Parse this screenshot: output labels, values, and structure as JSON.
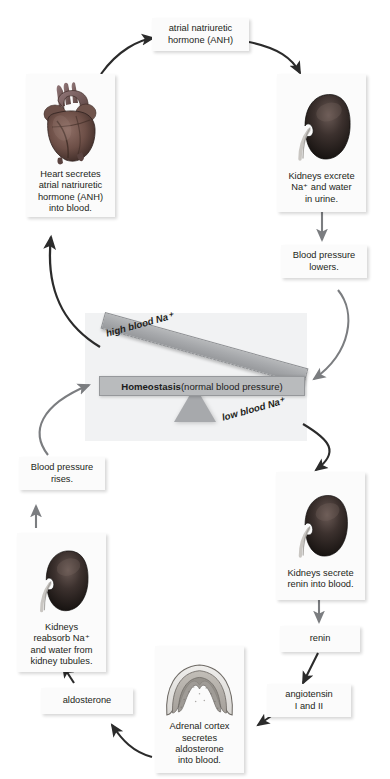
{
  "diagram": {
    "center_label": {
      "bold": "Homeostasis",
      "rest": " (normal blood pressure)"
    },
    "seesaw": {
      "high_label": "high blood Na⁺",
      "low_label": "low blood Na⁺"
    },
    "nodes": {
      "anh_hormone": "atrial natriuretic\nhormone (ANH)",
      "heart": "Heart secretes\natrial natriuretic\nhormone (ANH)\ninto blood.",
      "kidney_excrete": "Kidneys excrete\nNa⁺ and water\nin urine.",
      "bp_lowers": "Blood pressure\nlowers.",
      "kidney_renin": "Kidneys secrete\nrenin into blood.",
      "renin": "renin",
      "angiotensin": "angiotensin\nI and II",
      "adrenal": "Adrenal cortex\nsecretes\naldosterone\ninto blood.",
      "aldosterone": "aldosterone",
      "kidney_reabsorb": "Kidneys\nreabsorb Na⁺\nand water from\nkidney tubules.",
      "bp_rises": "Blood pressure\nrises."
    },
    "icons": {
      "heart": "heart-organ-image",
      "kidney": "kidney-organ-image",
      "adrenal": "adrenal-cortex-image"
    },
    "colors": {
      "arrow_dark": "#2b2b2b",
      "arrow_gray": "#7b7d80",
      "beam": "#a7a9ac",
      "panel": "#f1f2f3",
      "box": "#fbfbfb",
      "text": "#231f20"
    }
  }
}
